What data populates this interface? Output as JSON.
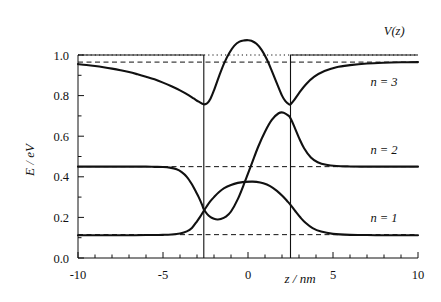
{
  "chart_data": {
    "type": "line",
    "title": "",
    "xlabel": "z / nm",
    "ylabel": "E / eV",
    "xlim": [
      -10,
      10
    ],
    "ylim": [
      0.0,
      1.0
    ],
    "grid": false,
    "legend_position": "right-inline",
    "xticks": [
      -10,
      -5,
      0,
      5,
      10
    ],
    "xtick_labels": [
      "-10",
      "-5",
      "0",
      "5",
      "10"
    ],
    "xminor_step": 1,
    "yticks": [
      0.0,
      0.2,
      0.4,
      0.6,
      0.8,
      1.0
    ],
    "ytick_labels": [
      "0.0",
      "0.2",
      "0.4",
      "0.6",
      "0.8",
      "1.0"
    ],
    "yminor_step": 0.1,
    "potential": {
      "name": "V(z)",
      "barrier_height_eV": 1.0,
      "well_left_nm": -2.6,
      "well_right_nm": 2.5,
      "well_bottom_eV": 0.0,
      "style": "solid"
    },
    "reference_dotted_level_eV": 1.0,
    "levels": [
      {
        "name": "n = 1",
        "energy_eV": 0.115,
        "style": "dashed"
      },
      {
        "name": "n = 2",
        "energy_eV": 0.45,
        "style": "dashed"
      },
      {
        "name": "n = 3",
        "energy_eV": 0.965,
        "style": "dashed"
      }
    ],
    "series": [
      {
        "name": "n = 1",
        "asymptote_eV": 0.115,
        "inside_peak_eV": 0.375,
        "inside_peak_z_nm": 0.5,
        "x": [
          -10,
          -9,
          -8,
          -7,
          -6,
          -5.5,
          -5,
          -4.5,
          -4,
          -3.6,
          -3.3,
          -3.0,
          -2.8,
          -2.6,
          -2.4,
          -2.2,
          -2.0,
          -1.7,
          -1.4,
          -1.0,
          -0.6,
          -0.2,
          0.2,
          0.5,
          0.9,
          1.3,
          1.7,
          2.0,
          2.3,
          2.5,
          2.8,
          3.1,
          3.4,
          3.8,
          4.3,
          5.0,
          6.0,
          7.0,
          8.0,
          9.0,
          10
        ],
        "y": [
          0.112,
          0.112,
          0.112,
          0.112,
          0.113,
          0.113,
          0.114,
          0.116,
          0.121,
          0.131,
          0.148,
          0.181,
          0.205,
          0.232,
          0.258,
          0.281,
          0.3,
          0.325,
          0.344,
          0.36,
          0.37,
          0.375,
          0.376,
          0.375,
          0.368,
          0.354,
          0.331,
          0.308,
          0.281,
          0.262,
          0.229,
          0.198,
          0.172,
          0.147,
          0.13,
          0.119,
          0.114,
          0.113,
          0.112,
          0.112,
          0.112
        ]
      },
      {
        "name": "n = 2",
        "asymptote_eV": 0.45,
        "inside_min_eV": 0.19,
        "inside_min_z_nm": -1.8,
        "inside_peak_eV": 0.715,
        "inside_peak_z_nm": 1.8,
        "x": [
          -10,
          -9,
          -8,
          -7,
          -6,
          -5.5,
          -5,
          -4.6,
          -4.2,
          -3.9,
          -3.6,
          -3.3,
          -3.1,
          -2.9,
          -2.7,
          -2.6,
          -2.4,
          -2.2,
          -2.0,
          -1.8,
          -1.6,
          -1.3,
          -1.0,
          -0.6,
          -0.2,
          0.2,
          0.6,
          1.0,
          1.4,
          1.8,
          2.1,
          2.4,
          2.5,
          2.7,
          3.0,
          3.3,
          3.7,
          4.1,
          4.6,
          5.2,
          6.0,
          7.0,
          8.0,
          9.0,
          10
        ],
        "y": [
          0.45,
          0.45,
          0.45,
          0.45,
          0.45,
          0.449,
          0.448,
          0.445,
          0.437,
          0.423,
          0.4,
          0.363,
          0.332,
          0.3,
          0.262,
          0.24,
          0.216,
          0.201,
          0.193,
          0.19,
          0.192,
          0.204,
          0.229,
          0.29,
          0.372,
          0.46,
          0.548,
          0.622,
          0.68,
          0.713,
          0.716,
          0.7,
          0.688,
          0.652,
          0.592,
          0.541,
          0.495,
          0.472,
          0.459,
          0.453,
          0.451,
          0.45,
          0.45,
          0.45,
          0.45
        ]
      },
      {
        "name": "n = 3",
        "asymptote_eV": 0.965,
        "inside_min_left_eV": 0.757,
        "inside_min_left_z_nm": -2.6,
        "inside_peak_eV": 1.072,
        "inside_peak_z_nm": 0.0,
        "inside_min_right_eV": 0.757,
        "inside_min_right_z_nm": 2.5,
        "x": [
          -10,
          -9.5,
          -9,
          -8.5,
          -8,
          -7.5,
          -7,
          -6.5,
          -6,
          -5.5,
          -5,
          -4.5,
          -4,
          -3.6,
          -3.2,
          -2.9,
          -2.6,
          -2.4,
          -2.2,
          -2.0,
          -1.7,
          -1.4,
          -1.1,
          -0.8,
          -0.5,
          -0.2,
          0,
          0.2,
          0.5,
          0.8,
          1.1,
          1.4,
          1.7,
          2.0,
          2.2,
          2.4,
          2.5,
          2.7,
          3.0,
          3.4,
          3.9,
          4.5,
          5.2,
          6.0,
          7.0,
          8.0,
          9.0,
          10
        ],
        "y": [
          0.955,
          0.951,
          0.946,
          0.94,
          0.933,
          0.925,
          0.916,
          0.905,
          0.893,
          0.88,
          0.864,
          0.846,
          0.826,
          0.807,
          0.786,
          0.77,
          0.757,
          0.762,
          0.786,
          0.826,
          0.896,
          0.96,
          1.01,
          1.046,
          1.066,
          1.072,
          1.073,
          1.07,
          1.055,
          1.025,
          0.98,
          0.922,
          0.86,
          0.8,
          0.773,
          0.758,
          0.757,
          0.776,
          0.812,
          0.855,
          0.893,
          0.921,
          0.94,
          0.95,
          0.958,
          0.962,
          0.964,
          0.965
        ]
      }
    ],
    "annotations": [
      {
        "text": "V(z)",
        "z_nm": 8.6,
        "E_eV": 1.1
      },
      {
        "text": "n = 3",
        "z_nm": 8.0,
        "E_eV": 0.845
      },
      {
        "text": "n = 2",
        "z_nm": 8.0,
        "E_eV": 0.51
      },
      {
        "text": "n = 1",
        "z_nm": 8.0,
        "E_eV": 0.175
      }
    ]
  },
  "axis": {
    "ylabel_text": "E / eV",
    "xlabel_text": "z / nm"
  }
}
